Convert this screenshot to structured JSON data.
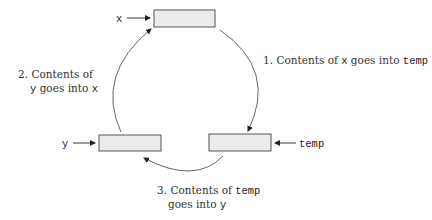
{
  "diagram": {
    "type": "swap-cycle",
    "variables": {
      "x": {
        "label": "x"
      },
      "y": {
        "label": "y"
      },
      "temp": {
        "label": "temp"
      }
    },
    "steps": [
      {
        "number": "1.",
        "text_a": "Contents of ",
        "var_a": "x",
        "text_b": " goes into ",
        "var_b": "temp"
      },
      {
        "number": "2.",
        "line1": "Contents of",
        "var_a": "y",
        "text_b": " goes into ",
        "var_b": "x"
      },
      {
        "number": "3.",
        "line1_text": "Contents of ",
        "var_a": "temp",
        "line2_text": "goes into ",
        "var_b": "y"
      }
    ],
    "colors": {
      "box_fill": "#ececec",
      "box_stroke": "#555555",
      "text": "#333333"
    }
  }
}
